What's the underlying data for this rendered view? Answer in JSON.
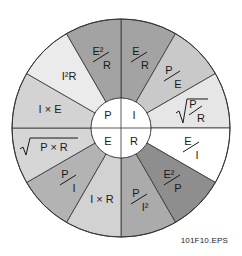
{
  "diagram": {
    "center": {
      "cx": 121,
      "cy": 128
    },
    "outer_radius": 109,
    "inner_radius": 30,
    "quadrants": [
      {
        "label": "P",
        "position": "top-left"
      },
      {
        "label": "I",
        "position": "top-right"
      },
      {
        "label": "E",
        "position": "bottom-left"
      },
      {
        "label": "R",
        "position": "bottom-right"
      }
    ],
    "segments": [
      {
        "formula": "E/R",
        "quantity": "I",
        "color": "#a3a3a3",
        "type": "frac",
        "num": "E",
        "den": "R"
      },
      {
        "formula": "P/E",
        "quantity": "I",
        "color": "#c9c9c9",
        "type": "frac",
        "num": "P",
        "den": "E"
      },
      {
        "formula": "√(P/R)",
        "quantity": "I",
        "color": "#e6e6e6",
        "type": "sqrtfrac",
        "num": "P",
        "den": "R"
      },
      {
        "formula": "E/I",
        "quantity": "R",
        "color": "#ffffff",
        "type": "frac",
        "num": "E",
        "den": "I"
      },
      {
        "formula": "E²/P",
        "quantity": "R",
        "color": "#8e8e8e",
        "type": "frac",
        "num": "E²",
        "den": "P"
      },
      {
        "formula": "P/I²",
        "quantity": "R",
        "color": "#ababab",
        "type": "frac",
        "num": "P",
        "den": "I²"
      },
      {
        "formula": "I × R",
        "quantity": "E",
        "color": "#d2d2d2",
        "type": "text",
        "text": "I × R"
      },
      {
        "formula": "P/I",
        "quantity": "E",
        "color": "#b3b3b3",
        "type": "frac",
        "num": "P",
        "den": "I"
      },
      {
        "formula": "√(P × R)",
        "quantity": "E",
        "color": "#d6d6d6",
        "type": "sqrt",
        "text": "P × R"
      },
      {
        "formula": "I × E",
        "quantity": "P",
        "color": "#d3d3d3",
        "type": "text",
        "text": "I × E"
      },
      {
        "formula": "I²R",
        "quantity": "P",
        "color": "#ebebeb",
        "type": "text",
        "text": "I²R"
      },
      {
        "formula": "E²/R",
        "quantity": "P",
        "color": "#a3a3a3",
        "type": "frac",
        "num": "E²",
        "den": "R"
      }
    ]
  },
  "caption": "101F10.EPS"
}
